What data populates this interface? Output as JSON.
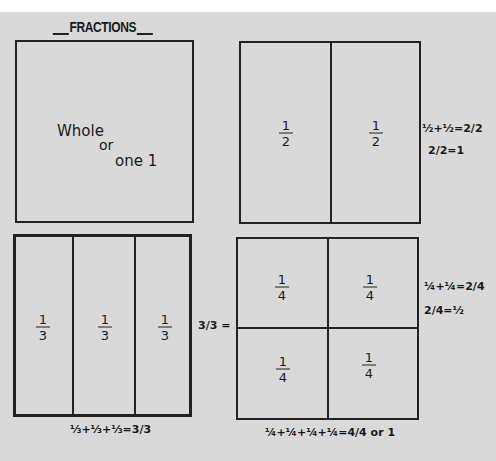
{
  "title": "FRACTIONS",
  "whole_box": {
    "line1": "Whole",
    "line2": "or",
    "line3": "one 1"
  },
  "halves_box": {
    "cells": [
      {
        "num": "1",
        "den": "2"
      },
      {
        "num": "1",
        "den": "2"
      }
    ],
    "note_line1": "½+½=2/2",
    "note_line2": "2/2=1"
  },
  "thirds_box": {
    "cells": [
      {
        "num": "1",
        "den": "3"
      },
      {
        "num": "1",
        "den": "3"
      },
      {
        "num": "1",
        "den": "3"
      }
    ],
    "side_note": "3/3 =",
    "bottom_note": "⅓+⅓+⅓=3/3"
  },
  "quarters_box": {
    "cells": [
      {
        "num": "1",
        "den": "4"
      },
      {
        "num": "1",
        "den": "4"
      },
      {
        "num": "1",
        "den": "4"
      },
      {
        "num": "1",
        "den": "4"
      }
    ],
    "note_line1": "¼+¼=2/4",
    "note_line2": "2/4=½",
    "bottom_note": "¼+¼+¼+¼=4/4 or 1"
  },
  "colors": {
    "paper": "#d9d9d9",
    "ink": "#222222",
    "background": "#ffffff"
  }
}
